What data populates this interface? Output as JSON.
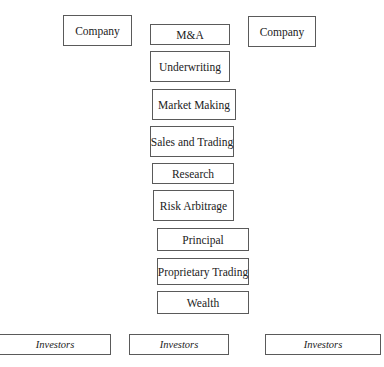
{
  "diagram": {
    "type": "stack",
    "top_row": {
      "left": {
        "label": "Company"
      },
      "right": {
        "label": "Company"
      }
    },
    "functions": [
      {
        "label": "M&A"
      },
      {
        "label": "Underwriting"
      },
      {
        "label": "Market Making"
      },
      {
        "label": "Sales and Trading"
      },
      {
        "label": "Research"
      },
      {
        "label": "Risk Arbitrage"
      },
      {
        "label": "Principal"
      },
      {
        "label": "Proprietary Trading"
      },
      {
        "label": "Wealth"
      }
    ],
    "bottom_row": [
      {
        "label": "Investors"
      },
      {
        "label": "Investors"
      },
      {
        "label": "Investors"
      }
    ],
    "colors": {
      "border": "#5a5a5a",
      "text": "#222222",
      "background": "#ffffff"
    }
  }
}
